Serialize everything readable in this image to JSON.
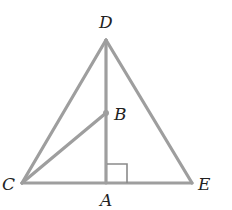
{
  "figure": {
    "type": "geometry",
    "line_color": "#9e9e9e",
    "label_color": "#222222",
    "points": {
      "D": {
        "label": "D"
      },
      "B": {
        "label": "B"
      },
      "C": {
        "label": "C"
      },
      "A": {
        "label": "A"
      },
      "E": {
        "label": "E"
      }
    },
    "segments": [
      "DC",
      "DE",
      "CE",
      "DA",
      "CB"
    ],
    "right_angle_at": "A"
  }
}
